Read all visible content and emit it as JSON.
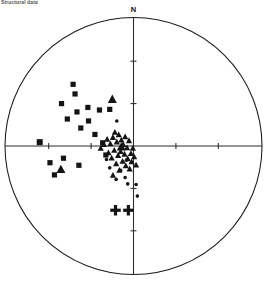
{
  "figure": {
    "caption": "Structural data",
    "type": "stereonet",
    "projection_label": "N",
    "center": {
      "x": 133.5,
      "y": 146.0
    },
    "radius": 128.5
  },
  "axes": {
    "north_label": "N",
    "vertical_axis": true,
    "horizontal_axis": true,
    "tick_positions_fraction": [
      0.33,
      0.66
    ],
    "tick_length": 6
  },
  "chart_data": {
    "type": "scatter",
    "title": "",
    "subtitle": "",
    "xlabel": "",
    "ylabel": "",
    "xlim": [
      -1,
      1
    ],
    "ylim": [
      -1,
      1
    ],
    "grid": false,
    "legend": null,
    "projection": "equal-area lower-hemisphere stereonet",
    "axis_labels": {
      "top": "N"
    },
    "series": [
      {
        "name": "squares",
        "marker": "square",
        "color": "#141414",
        "count": 18,
        "points": [
          {
            "x": -0.73,
            "y": 0.03
          },
          {
            "x": -0.65,
            "y": -0.13
          },
          {
            "x": -0.615,
            "y": -0.225
          },
          {
            "x": -0.56,
            "y": 0.33
          },
          {
            "x": -0.545,
            "y": -0.095
          },
          {
            "x": -0.515,
            "y": 0.21
          },
          {
            "x": -0.47,
            "y": 0.48
          },
          {
            "x": -0.455,
            "y": 0.405
          },
          {
            "x": -0.44,
            "y": 0.265
          },
          {
            "x": -0.425,
            "y": -0.15
          },
          {
            "x": -0.41,
            "y": 0.14
          },
          {
            "x": -0.355,
            "y": 0.3
          },
          {
            "x": -0.35,
            "y": 0.195
          },
          {
            "x": -0.3,
            "y": 0.09
          },
          {
            "x": -0.265,
            "y": 0.28
          },
          {
            "x": -0.185,
            "y": 0.285
          },
          {
            "x": -0.24,
            "y": 0.025
          },
          {
            "x": -0.215,
            "y": -0.07
          }
        ]
      },
      {
        "name": "triangles",
        "marker": "triangle",
        "color": "#141414",
        "count": 34,
        "points": [
          {
            "x": -0.565,
            "y": -0.185
          },
          {
            "x": -0.165,
            "y": 0.36
          },
          {
            "x": -0.095,
            "y": -0.01
          },
          {
            "x": -0.255,
            "y": -0.02
          },
          {
            "x": -0.23,
            "y": 0.01
          },
          {
            "x": -0.205,
            "y": 0.05
          },
          {
            "x": -0.195,
            "y": -0.055
          },
          {
            "x": -0.18,
            "y": 0.015
          },
          {
            "x": -0.17,
            "y": -0.095
          },
          {
            "x": -0.16,
            "y": 0.065
          },
          {
            "x": -0.15,
            "y": -0.035
          },
          {
            "x": -0.145,
            "y": 0.105
          },
          {
            "x": -0.135,
            "y": -0.14
          },
          {
            "x": -0.13,
            "y": 0.03
          },
          {
            "x": -0.12,
            "y": -0.075
          },
          {
            "x": -0.115,
            "y": 0.085
          },
          {
            "x": -0.11,
            "y": -0.19
          },
          {
            "x": -0.1,
            "y": -0.045
          },
          {
            "x": -0.095,
            "y": 0.045
          },
          {
            "x": -0.085,
            "y": -0.12
          },
          {
            "x": -0.08,
            "y": 0.01
          },
          {
            "x": -0.07,
            "y": -0.065
          },
          {
            "x": -0.065,
            "y": 0.07
          },
          {
            "x": -0.06,
            "y": -0.155
          },
          {
            "x": -0.05,
            "y": -0.015
          },
          {
            "x": -0.045,
            "y": -0.1
          },
          {
            "x": -0.035,
            "y": 0.04
          },
          {
            "x": -0.03,
            "y": -0.18
          },
          {
            "x": -0.02,
            "y": -0.06
          },
          {
            "x": -0.015,
            "y": -0.125
          },
          {
            "x": -0.005,
            "y": -0.02
          },
          {
            "x": 0.005,
            "y": -0.085
          },
          {
            "x": 0.02,
            "y": -0.15
          },
          {
            "x": -0.16,
            "y": -0.23
          }
        ]
      },
      {
        "name": "circles",
        "marker": "circle",
        "color": "#141414",
        "count": 10,
        "points": [
          {
            "x": -0.13,
            "y": 0.195
          },
          {
            "x": -0.055,
            "y": -0.11
          },
          {
            "x": -0.1,
            "y": -0.19
          },
          {
            "x": -0.065,
            "y": -0.245
          },
          {
            "x": -0.135,
            "y": -0.26
          },
          {
            "x": -0.045,
            "y": -0.295
          },
          {
            "x": 0.02,
            "y": -0.3
          },
          {
            "x": 0.03,
            "y": -0.39
          },
          {
            "x": -0.185,
            "y": -0.17
          },
          {
            "x": -0.21,
            "y": -0.105
          }
        ]
      },
      {
        "name": "plus",
        "marker": "plus",
        "color": "#141414",
        "count": 2,
        "points": [
          {
            "x": -0.14,
            "y": -0.5
          },
          {
            "x": -0.04,
            "y": -0.5
          }
        ]
      }
    ]
  }
}
